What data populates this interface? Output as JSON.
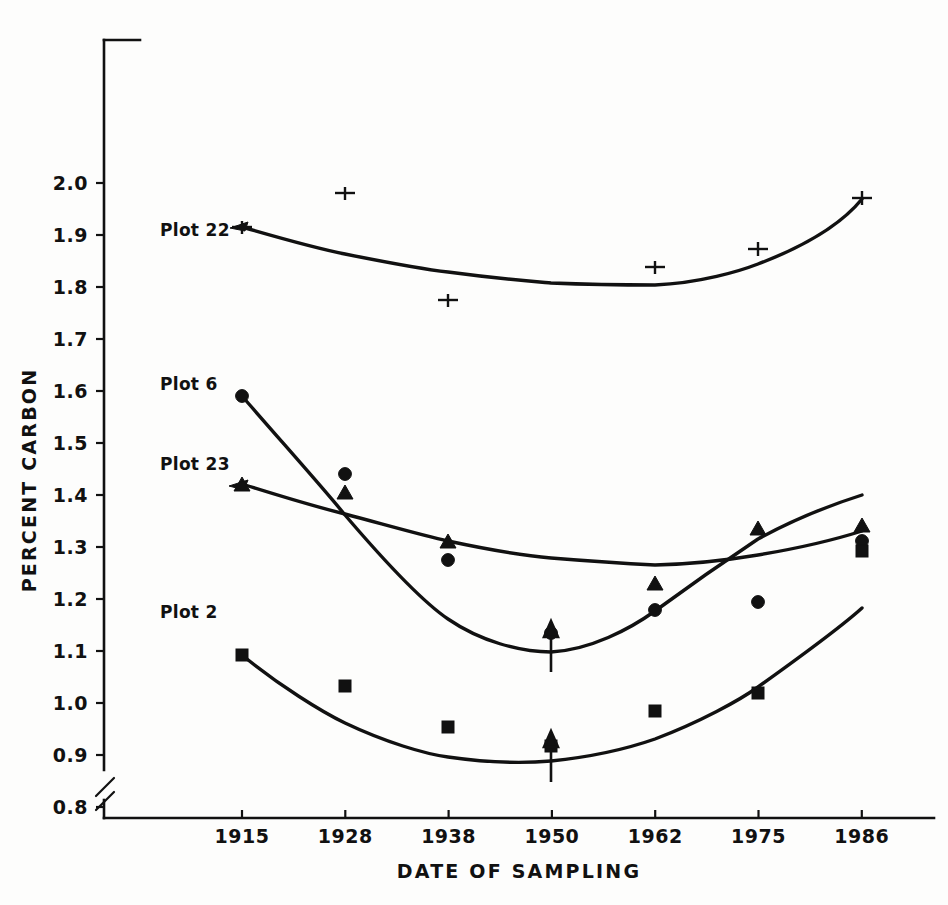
{
  "chart_data": {
    "type": "line",
    "title": "",
    "subtitle": "",
    "xlabel": "DATE OF SAMPLING",
    "ylabel": "PERCENT CARBON",
    "categories": [
      "1915",
      "1928",
      "1938",
      "1950",
      "1962",
      "1975",
      "1986"
    ],
    "x_tick_labels": [
      "1915",
      "1928",
      "1938",
      "1950",
      "1962",
      "1975",
      "1986"
    ],
    "y_tick_labels": [
      "2.0",
      "1.9",
      "1.8",
      "1.7",
      "1.6",
      "1.5",
      "1.4",
      "1.3",
      "1.2",
      "1.1",
      "1.0",
      "0.9",
      "0.8"
    ],
    "ylim": [
      0.8,
      2.0
    ],
    "xlim": [
      1915,
      1986
    ],
    "grid": false,
    "legend_position": "inline-labels",
    "y_axis_break": true,
    "series": [
      {
        "name": "Plot 22",
        "label": "Plot 22",
        "marker": "error-bar",
        "values": [
          1.915,
          1.98,
          1.755,
          null,
          1.835,
          1.87,
          1.97
        ],
        "fitted_curve": [
          1.915,
          1.88,
          1.855,
          1.838,
          1.835,
          1.875,
          1.965
        ]
      },
      {
        "name": "Plot 6",
        "label": "Plot 6",
        "marker": "circle",
        "values": [
          1.59,
          1.44,
          1.275,
          null,
          1.155,
          1.17,
          1.285
        ],
        "fitted_curve": [
          1.59,
          1.43,
          1.265,
          1.135,
          1.11,
          1.195,
          1.29
        ]
      },
      {
        "name": "Plot 23",
        "label": "Plot 23",
        "marker": "triangle",
        "values": [
          1.42,
          1.405,
          1.31,
          null,
          1.19,
          1.3,
          1.305
        ],
        "fitted_curve": [
          1.42,
          1.375,
          1.33,
          1.295,
          1.272,
          1.282,
          1.305
        ]
      },
      {
        "name": "Plot 2",
        "label": "Plot 2",
        "marker": "square",
        "values": [
          1.135,
          0.995,
          0.915,
          null,
          0.945,
          0.98,
          1.255
        ],
        "fitted_curve": [
          1.135,
          1.015,
          0.93,
          0.893,
          0.92,
          1.01,
          1.17
        ]
      }
    ],
    "annotations": [
      {
        "name": "arrow-plot6-1950",
        "x": "1950",
        "y": 1.075,
        "symbol": "up-arrow"
      },
      {
        "name": "arrow-plot2-1950",
        "x": "1950",
        "y": 0.855,
        "symbol": "up-arrow"
      }
    ]
  },
  "labels": {
    "plot22": "Plot 22",
    "plot6": "Plot 6",
    "plot23": "Plot 23",
    "plot2": "Plot 2",
    "xaxis": "DATE OF SAMPLING",
    "yaxis": "PERCENT CARBON"
  },
  "ticks": {
    "y": [
      "2.0",
      "1.9",
      "1.8",
      "1.7",
      "1.6",
      "1.5",
      "1.4",
      "1.3",
      "1.2",
      "1.1",
      "1.0",
      "0.9",
      "0.8"
    ],
    "x": [
      "1915",
      "1928",
      "1938",
      "1950",
      "1962",
      "1975",
      "1986"
    ]
  }
}
